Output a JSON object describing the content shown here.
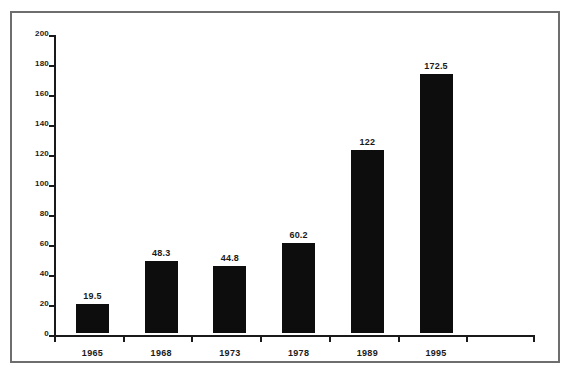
{
  "chart_data": {
    "type": "bar",
    "title": "",
    "xlabel": "",
    "ylabel": "",
    "categories": [
      "1965",
      "1968",
      "1973",
      "1978",
      "1989",
      "1995"
    ],
    "values": [
      19.5,
      48.3,
      44.8,
      60.2,
      122,
      172.5
    ],
    "value_labels": [
      "19.5",
      "48.3",
      "44.8",
      "60.2",
      "122",
      "172.5"
    ],
    "ylim": [
      0,
      200
    ],
    "ytick_step": 20,
    "yticks": [
      0,
      20,
      40,
      60,
      80,
      100,
      120,
      140,
      160,
      180,
      200
    ],
    "ytick_labels": [
      "0",
      "20",
      "40",
      "60",
      "80",
      "100",
      "120",
      "140",
      "160",
      "180",
      "200"
    ],
    "grid": false,
    "legend": false,
    "legend_position": "none",
    "bar_color": "#0d0d0d",
    "axis_color": "#1a1a1a",
    "frame_color": "#6e6e6e",
    "background_color": "#ffffff"
  },
  "figure": {
    "caption": ""
  }
}
